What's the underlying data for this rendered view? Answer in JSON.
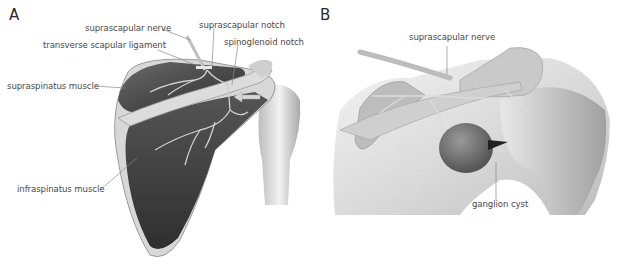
{
  "figure": {
    "panels": [
      {
        "letter": "A",
        "labels": {
          "suprascapular_nerve": "suprascapular nerve",
          "suprascapular_notch": "suprascapular notch",
          "transverse_scapular_ligament": "transverse scapular ligament",
          "spinoglenoid_notch": "spinoglenoid notch",
          "supraspinatus_muscle": "supraspinatus muscle",
          "infraspinatus_muscle": "infraspinatus muscle"
        }
      },
      {
        "letter": "B",
        "labels": {
          "suprascapular_nerve": "suprascapular nerve",
          "ganglion_cyst": "ganglion cyst"
        }
      }
    ],
    "colors": {
      "muscle_dark": "#3c3c3c",
      "muscle_mid": "#5a5a5a",
      "bone_light": "#e6e6e6",
      "nerve": "#c8c8c8",
      "label_text": "#4a4a4a",
      "leader_line": "#888888",
      "cyst": "#6a6a6a"
    }
  }
}
